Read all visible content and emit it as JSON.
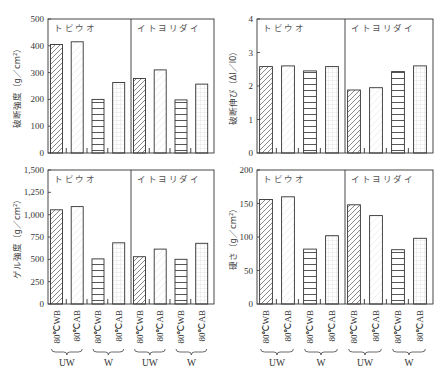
{
  "chart_data": [
    {
      "type": "bar",
      "title": "",
      "ylabel": "破断強度（g／cm²）",
      "ylim": [
        0,
        500
      ],
      "yticks": [
        "0",
        "100",
        "200",
        "300",
        "400",
        "500"
      ],
      "categories": [
        "80℃WB",
        "80℃AB",
        "80℃WB",
        "80℃AB"
      ],
      "category_groups": [
        "UW",
        "UW",
        "W",
        "W"
      ],
      "series": [
        {
          "name": "トビウオ",
          "values": [
            405,
            415,
            200,
            263
          ]
        },
        {
          "name": "イトヨリダイ",
          "values": [
            278,
            310,
            198,
            257
          ]
        }
      ]
    },
    {
      "type": "bar",
      "title": "",
      "ylabel": "破断伸び（Δl／l0）",
      "ylim": [
        0,
        4
      ],
      "yticks": [
        "0",
        "1",
        "2",
        "3",
        "4"
      ],
      "categories": [
        "80℃WB",
        "80℃AB",
        "80℃WB",
        "80℃AB"
      ],
      "category_groups": [
        "UW",
        "UW",
        "W",
        "W"
      ],
      "series": [
        {
          "name": "トビウオ",
          "values": [
            2.58,
            2.6,
            2.45,
            2.58
          ]
        },
        {
          "name": "イトヨリダイ",
          "values": [
            1.88,
            1.95,
            2.43,
            2.6
          ]
        }
      ]
    },
    {
      "type": "bar",
      "title": "",
      "ylabel": "ゲル強度（g／cm²）",
      "ylim": [
        0,
        1500
      ],
      "yticks": [
        "0",
        "250",
        "500",
        "750",
        "1,000",
        "1,250",
        "1,500"
      ],
      "categories": [
        "80℃WB",
        "80℃AB",
        "80℃WB",
        "80℃AB"
      ],
      "category_groups": [
        "UW",
        "UW",
        "W",
        "W"
      ],
      "series": [
        {
          "name": "トビウオ",
          "values": [
            1055,
            1090,
            505,
            685
          ]
        },
        {
          "name": "イトヨリダイ",
          "values": [
            530,
            615,
            500,
            680
          ]
        }
      ]
    },
    {
      "type": "bar",
      "title": "",
      "ylabel": "硬さ（g／cm²）",
      "ylim": [
        0,
        200
      ],
      "yticks": [
        "0",
        "50",
        "100",
        "150",
        "200"
      ],
      "categories": [
        "80℃WB",
        "80℃AB",
        "80℃WB",
        "80℃AB"
      ],
      "category_groups": [
        "UW",
        "UW",
        "W",
        "W"
      ],
      "series": [
        {
          "name": "トビウオ",
          "values": [
            156,
            160,
            82,
            102
          ]
        },
        {
          "name": "イトヨリダイ",
          "values": [
            148,
            132,
            81,
            98
          ]
        }
      ]
    }
  ],
  "labels": {
    "species": [
      "トビウオ",
      "イトヨリダイ"
    ],
    "categories": [
      "80℃WB",
      "80℃AB"
    ],
    "groups": [
      "UW",
      "W"
    ]
  }
}
